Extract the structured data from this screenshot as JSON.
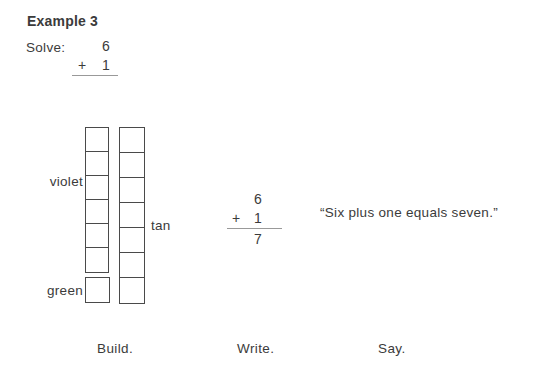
{
  "title": "Example 3",
  "solve": {
    "label": "Solve:",
    "top_operand": "6",
    "operator": "+",
    "bottom_operand": "1"
  },
  "build": {
    "caption": "Build.",
    "towers": [
      {
        "name": "six-bar",
        "color_label": "violet",
        "blocks": 6
      },
      {
        "name": "unit-block",
        "color_label": "green",
        "blocks": 1
      },
      {
        "name": "seven-bar",
        "color_label": "tan",
        "blocks": 7
      }
    ]
  },
  "write": {
    "caption": "Write.",
    "top_operand": "6",
    "operator": "+",
    "bottom_operand": "1",
    "result": "7"
  },
  "say": {
    "caption": "Say.",
    "quote": "“Six plus one equals seven.”"
  },
  "colors": {
    "text": "#3b3b3b",
    "block_border": "#4a4a4a",
    "rule": "#999999"
  }
}
